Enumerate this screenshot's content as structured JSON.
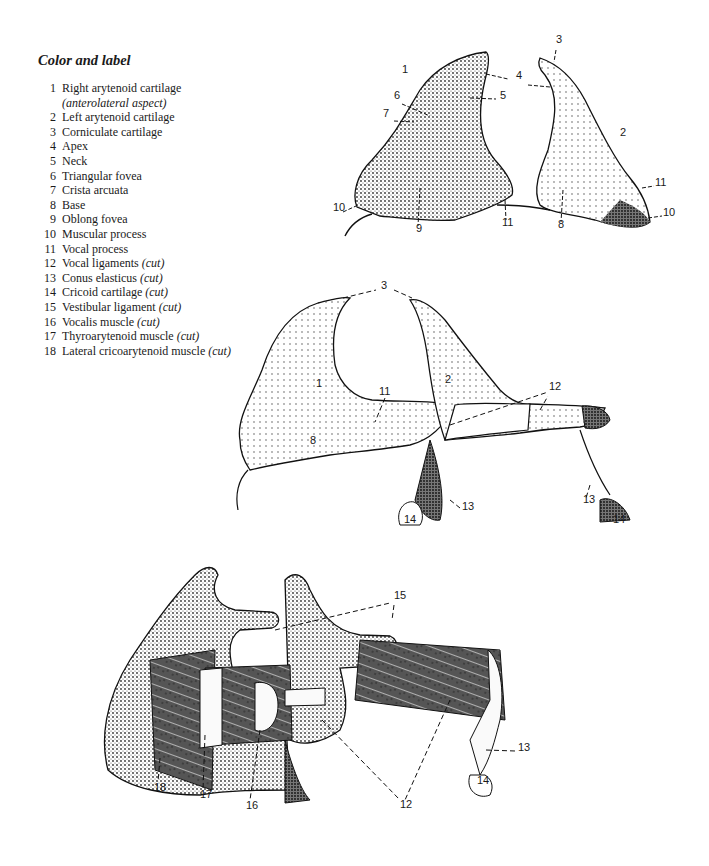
{
  "legend": {
    "title": "Color and label",
    "items": [
      {
        "num": "1",
        "text": "Right arytenoid cartilage",
        "sub": "(anterolateral aspect)",
        "cut": ""
      },
      {
        "num": "2",
        "text": "Left arytenoid cartilage",
        "sub": "",
        "cut": ""
      },
      {
        "num": "3",
        "text": "Corniculate cartilage",
        "sub": "",
        "cut": ""
      },
      {
        "num": "4",
        "text": "Apex",
        "sub": "",
        "cut": ""
      },
      {
        "num": "5",
        "text": "Neck",
        "sub": "",
        "cut": ""
      },
      {
        "num": "6",
        "text": "Triangular fovea",
        "sub": "",
        "cut": ""
      },
      {
        "num": "7",
        "text": "Crista arcuata",
        "sub": "",
        "cut": ""
      },
      {
        "num": "8",
        "text": "Base",
        "sub": "",
        "cut": ""
      },
      {
        "num": "9",
        "text": "Oblong fovea",
        "sub": "",
        "cut": ""
      },
      {
        "num": "10",
        "text": "Muscular process",
        "sub": "",
        "cut": ""
      },
      {
        "num": "11",
        "text": "Vocal process",
        "sub": "",
        "cut": ""
      },
      {
        "num": "12",
        "text": "Vocal ligaments",
        "sub": "",
        "cut": "(cut)"
      },
      {
        "num": "13",
        "text": "Conus elasticus",
        "sub": "",
        "cut": "(cut)"
      },
      {
        "num": "14",
        "text": "Cricoid cartilage",
        "sub": "",
        "cut": "(cut)"
      },
      {
        "num": "15",
        "text": "Vestibular ligament",
        "sub": "",
        "cut": "(cut)"
      },
      {
        "num": "16",
        "text": "Vocalis muscle",
        "sub": "",
        "cut": "(cut)"
      },
      {
        "num": "17",
        "text": "Thyroarytenoid muscle",
        "sub": "",
        "cut": "(cut)"
      },
      {
        "num": "18",
        "text": "Lateral cricoarytenoid muscle",
        "sub": "",
        "cut": "(cut)"
      }
    ]
  },
  "figures": {
    "top": {
      "labels": [
        {
          "text": "1",
          "x": 402,
          "y": 70
        },
        {
          "text": "3",
          "x": 556,
          "y": 40
        },
        {
          "text": "4",
          "x": 516,
          "y": 76
        },
        {
          "text": "5",
          "x": 500,
          "y": 96
        },
        {
          "text": "6",
          "x": 394,
          "y": 96
        },
        {
          "text": "7",
          "x": 383,
          "y": 114
        },
        {
          "text": "2",
          "x": 620,
          "y": 133
        },
        {
          "text": "11",
          "x": 655,
          "y": 183
        },
        {
          "text": "10",
          "x": 333,
          "y": 208
        },
        {
          "text": "10",
          "x": 663,
          "y": 213
        },
        {
          "text": "9",
          "x": 416,
          "y": 229
        },
        {
          "text": "11",
          "x": 502,
          "y": 223
        },
        {
          "text": "8",
          "x": 558,
          "y": 225
        }
      ]
    },
    "middle": {
      "labels": [
        {
          "text": "3",
          "x": 381,
          "y": 286
        },
        {
          "text": "1",
          "x": 316,
          "y": 384
        },
        {
          "text": "2",
          "x": 445,
          "y": 380
        },
        {
          "text": "11",
          "x": 379,
          "y": 392
        },
        {
          "text": "12",
          "x": 549,
          "y": 387
        },
        {
          "text": "8",
          "x": 310,
          "y": 441
        },
        {
          "text": "13",
          "x": 462,
          "y": 507
        },
        {
          "text": "14",
          "x": 404,
          "y": 520
        },
        {
          "text": "13",
          "x": 583,
          "y": 500
        },
        {
          "text": "14",
          "x": 613,
          "y": 520
        }
      ]
    },
    "bottom": {
      "labels": [
        {
          "text": "15",
          "x": 394,
          "y": 596
        },
        {
          "text": "13",
          "x": 518,
          "y": 748
        },
        {
          "text": "14",
          "x": 477,
          "y": 781
        },
        {
          "text": "18",
          "x": 154,
          "y": 788
        },
        {
          "text": "17",
          "x": 200,
          "y": 795
        },
        {
          "text": "16",
          "x": 246,
          "y": 806
        },
        {
          "text": "12",
          "x": 400,
          "y": 805
        }
      ]
    }
  }
}
